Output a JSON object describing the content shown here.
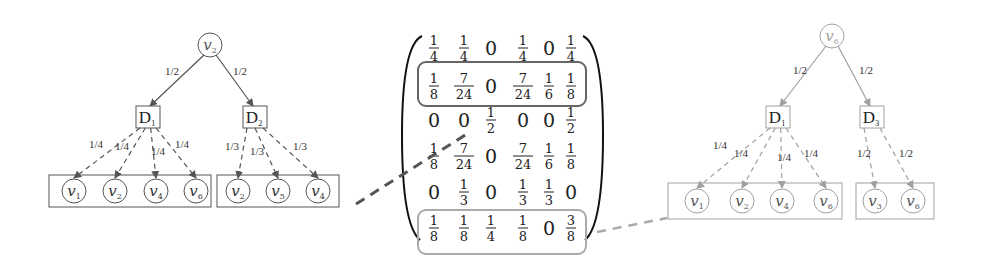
{
  "left_tree": {
    "root": {
      "label": "v",
      "sub": "2"
    },
    "edge_labels_top": [
      "1/2",
      "1/2"
    ],
    "decisions": [
      {
        "label": "D",
        "sub": "1",
        "edge_labels": [
          "1/4",
          "1/4",
          "1/4",
          "1/4"
        ],
        "children": [
          {
            "label": "v",
            "sub": "1"
          },
          {
            "label": "v",
            "sub": "2"
          },
          {
            "label": "v",
            "sub": "4"
          },
          {
            "label": "v",
            "sub": "6"
          }
        ]
      },
      {
        "label": "D",
        "sub": "2",
        "edge_labels": [
          "1/3",
          "1/3",
          "1/3"
        ],
        "children": [
          {
            "label": "v",
            "sub": "2"
          },
          {
            "label": "v",
            "sub": "5"
          },
          {
            "label": "v",
            "sub": "4"
          }
        ]
      }
    ],
    "color": "#555555"
  },
  "matrix": {
    "rows": [
      [
        "1/4",
        "1/4",
        "0",
        "1/4",
        "0",
        "1/4"
      ],
      [
        "1/8",
        "7/24",
        "0",
        "7/24",
        "1/6",
        "1/8"
      ],
      [
        "0",
        "0",
        "1/2",
        "0",
        "0",
        "1/2"
      ],
      [
        "1/8",
        "7/24",
        "0",
        "7/24",
        "1/6",
        "1/8"
      ],
      [
        "0",
        "1/3",
        "0",
        "1/3",
        "1/3",
        "0"
      ],
      [
        "1/8",
        "1/8",
        "1/4",
        "1/8",
        "0",
        "3/8"
      ]
    ],
    "highlight_rows": [
      1,
      5
    ],
    "highlight_colors": [
      "#666666",
      "#aaaaaa"
    ]
  },
  "right_tree": {
    "root": {
      "label": "v",
      "sub": "6"
    },
    "edge_labels_top": [
      "1/2",
      "1/2"
    ],
    "decisions": [
      {
        "label": "D",
        "sub": "1",
        "edge_labels": [
          "1/4",
          "1/4",
          "1/4",
          "1/4"
        ],
        "children": [
          {
            "label": "v",
            "sub": "1"
          },
          {
            "label": "v",
            "sub": "2"
          },
          {
            "label": "v",
            "sub": "4"
          },
          {
            "label": "v",
            "sub": "6"
          }
        ]
      },
      {
        "label": "D",
        "sub": "3",
        "edge_labels": [
          "1/2",
          "1/2"
        ],
        "children": [
          {
            "label": "v",
            "sub": "3"
          },
          {
            "label": "v",
            "sub": "6"
          }
        ]
      }
    ],
    "color": "#a0a0a0"
  }
}
